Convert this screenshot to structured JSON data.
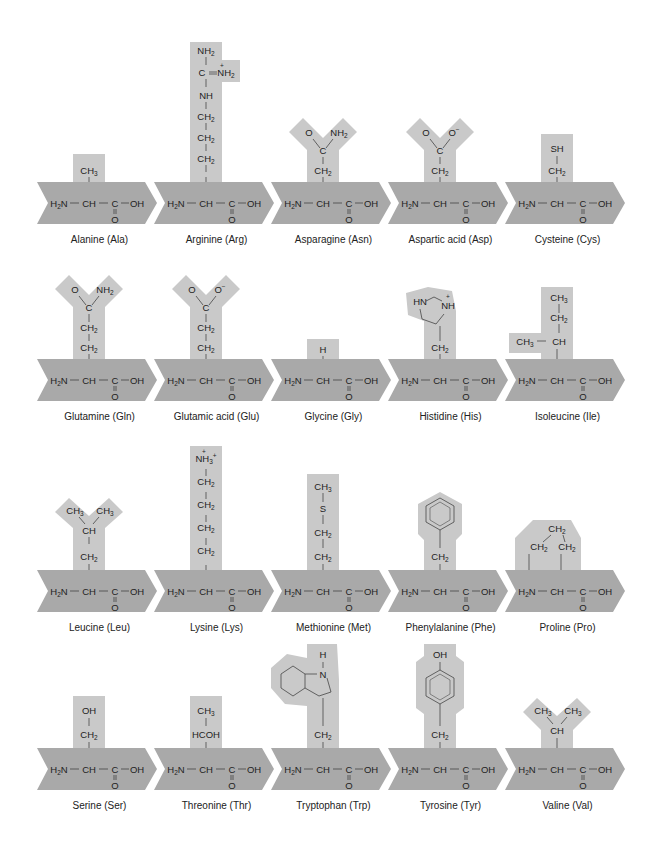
{
  "colors": {
    "backbone": "#a9a9a9",
    "side_chain": "#c9c9c9",
    "text": "#222222",
    "background": "#ffffff"
  },
  "backbone": {
    "amine": "H2N",
    "alpha": "CH",
    "carboxyl_c": "C",
    "hydroxyl": "OH",
    "carbonyl_o": "O"
  },
  "amino_acids": [
    {
      "name": "Alanine (Ala)",
      "side_chain": [
        "CH3"
      ]
    },
    {
      "name": "Arginine (Arg)",
      "side_chain": [
        "NH2",
        "C=NH2+",
        "NH",
        "CH2",
        "CH2",
        "CH2"
      ]
    },
    {
      "name": "Asparagine (Asn)",
      "side_chain": [
        "O",
        "NH2",
        "C",
        "CH2"
      ]
    },
    {
      "name": "Aspartic acid (Asp)",
      "side_chain": [
        "O",
        "O-",
        "C",
        "CH2"
      ]
    },
    {
      "name": "Cysteine (Cys)",
      "side_chain": [
        "SH",
        "CH2"
      ]
    },
    {
      "name": "Glutamine (Gln)",
      "side_chain": [
        "O",
        "NH2",
        "C",
        "CH2",
        "CH2"
      ]
    },
    {
      "name": "Glutamic acid (Glu)",
      "side_chain": [
        "O",
        "O-",
        "C",
        "CH2",
        "CH2"
      ]
    },
    {
      "name": "Glycine (Gly)",
      "side_chain": [
        "H"
      ]
    },
    {
      "name": "Histidine (His)",
      "side_chain": [
        "HN",
        "NH+",
        "imidazole ring",
        "CH2"
      ]
    },
    {
      "name": "Isoleucine (Ile)",
      "side_chain": [
        "CH3",
        "CH2",
        "CH3",
        "CH"
      ]
    },
    {
      "name": "Leucine (Leu)",
      "side_chain": [
        "CH3",
        "CH3",
        "CH",
        "CH2"
      ]
    },
    {
      "name": "Lysine (Lys)",
      "side_chain": [
        "NH3+",
        "CH2",
        "CH2",
        "CH2",
        "CH2"
      ]
    },
    {
      "name": "Methionine (Met)",
      "side_chain": [
        "CH3",
        "S",
        "CH2",
        "CH2"
      ]
    },
    {
      "name": "Phenylalanine (Phe)",
      "side_chain": [
        "benzene ring",
        "CH2"
      ]
    },
    {
      "name": "Proline (Pro)",
      "side_chain": [
        "CH2",
        "CH2",
        "CH2"
      ]
    },
    {
      "name": "Serine (Ser)",
      "side_chain": [
        "OH",
        "CH2"
      ]
    },
    {
      "name": "Threonine (Thr)",
      "side_chain": [
        "CH3",
        "HCOH"
      ]
    },
    {
      "name": "Tryptophan (Trp)",
      "side_chain": [
        "H",
        "N",
        "indole ring",
        "CH2"
      ]
    },
    {
      "name": "Tyrosine (Tyr)",
      "side_chain": [
        "OH",
        "benzene ring",
        "CH2"
      ]
    },
    {
      "name": "Valine (Val)",
      "side_chain": [
        "CH3",
        "CH3",
        "CH"
      ]
    }
  ]
}
